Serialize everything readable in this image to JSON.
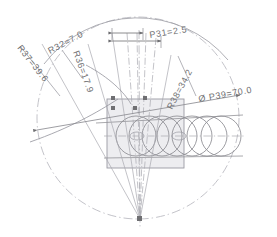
{
  "drawing": {
    "type": "engineering-cad-dimension-drawing",
    "title": "Rotary cutter path geometry",
    "background": "#ffffff",
    "line_color": "#8c8c92",
    "construction_color": "#a9a9b0",
    "text_color": "#6f6f72",
    "fill_color": "#ededf0",
    "fill_stroke": "#9a9aa2"
  },
  "dimensions": [
    {
      "id": "R32",
      "label": "R32=7.0",
      "value": 7.0,
      "prefix": "R",
      "name": "radius-r32"
    },
    {
      "id": "R36",
      "label": "R36=17.9",
      "value": 17.9,
      "prefix": "R",
      "name": "radius-r36"
    },
    {
      "id": "R37",
      "label": "R37=39.6",
      "value": 39.6,
      "prefix": "R",
      "name": "radius-r37"
    },
    {
      "id": "R38",
      "label": "R38=34.2",
      "value": 34.2,
      "prefix": "R",
      "name": "radius-r38"
    },
    {
      "id": "P31",
      "label": "P31=2.5",
      "value": 2.5,
      "prefix": "P",
      "name": "pitch-p31"
    },
    {
      "id": "P39",
      "label": "Ø P39=70.0",
      "value": 70.0,
      "prefix": "ØP",
      "name": "diameter-p39"
    }
  ],
  "geometry": {
    "outer_circle": {
      "cx": 138,
      "cy": 118,
      "r": 101,
      "style": "dash-dot"
    },
    "apex": {
      "x": 140,
      "y": 219
    },
    "rect": {
      "x": 107,
      "y": 99,
      "w": 77,
      "h": 69
    },
    "circle_chain": {
      "count": 7,
      "cy": 136,
      "r": 20,
      "centers_x": [
        136,
        149,
        162,
        177,
        192,
        207,
        221
      ]
    },
    "radial_lines": 6,
    "arc_r36": {
      "note": "swept arc from left tangent into rectangle top"
    }
  },
  "annotations": {
    "arrow_rows": [
      {
        "id": "row1",
        "y": 33,
        "x1": 112,
        "x2": 143
      },
      {
        "id": "row2",
        "y": 41,
        "x1": 112,
        "x2": 160
      }
    ],
    "diameter_line": {
      "x1": 37,
      "y1": 130,
      "x2": 240,
      "y2": 95
    }
  }
}
